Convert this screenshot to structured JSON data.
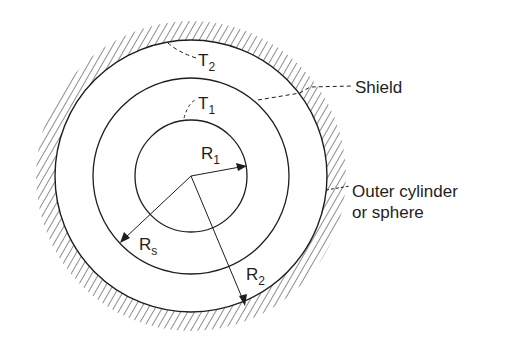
{
  "diagram": {
    "center": {
      "x": 191,
      "y": 176
    },
    "radii": {
      "inner": 56,
      "shield": 98,
      "outer": 136
    },
    "colors": {
      "stroke": "#1e1e1e",
      "background": "#ffffff"
    },
    "labels": {
      "t1": {
        "main": "T",
        "sub": "1"
      },
      "t2": {
        "main": "T",
        "sub": "2"
      },
      "r1": {
        "main": "R",
        "sub": "1"
      },
      "rs": {
        "main": "R",
        "sub": "s"
      },
      "r2": {
        "main": "R",
        "sub": "2"
      },
      "shield": "Shield",
      "outer_line1": "Outer cylinder",
      "outer_line2": "or sphere"
    }
  }
}
